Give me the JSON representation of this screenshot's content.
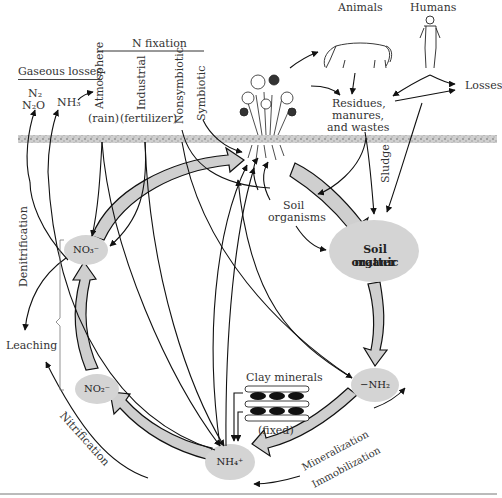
{
  "diagram": {
    "header": {
      "n_fixation": "N fixation",
      "gaseous_losses": "Gaseous losses"
    },
    "gases": {
      "n2": "N₂",
      "n2o": "N₂O",
      "nh3": "NH₃"
    },
    "fixation_types": [
      {
        "label": "Atmosphere",
        "sub": "(rain)"
      },
      {
        "label": "Industrial",
        "sub": "(fertilizer)"
      },
      {
        "label": "Nonsymbiotic",
        "sub": ""
      },
      {
        "label": "Symbiotic",
        "sub": ""
      }
    ],
    "top_right": {
      "animals": "Animals",
      "humans": "Humans",
      "losses": "Losses",
      "residues": [
        "Residues,",
        "manures,",
        "and wastes"
      ],
      "sludge": "Sludge"
    },
    "soil": {
      "soil_organisms": [
        "Soil",
        "organisms"
      ],
      "soil_organic_matter": [
        "Soil organic",
        "matter"
      ]
    },
    "pools": {
      "no3": "NO₃⁻",
      "no2": "NO₂⁻",
      "nh4": "NH₄⁺",
      "nh2": "−NH₂"
    },
    "processes": {
      "denitrification": "Denitrification",
      "leaching": "Leaching",
      "nitrification": "Nitrification",
      "mineralization": "Mineralization",
      "immobilization": "Immobilization"
    },
    "clay": {
      "label": "Clay minerals",
      "fixed": "(fixed)"
    },
    "colors": {
      "pool_fill": "#d4d4d4",
      "flow_fill": "#cfcfcf",
      "line": "#111111",
      "soil_band": "#bdbdbd"
    }
  }
}
